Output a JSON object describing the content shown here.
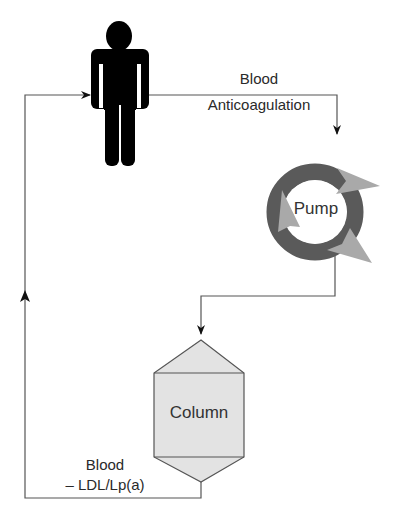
{
  "diagram": {
    "type": "flow-diagram",
    "nodes": {
      "patient": {
        "icon": "person-icon"
      },
      "pump": {
        "label": "Pump",
        "icon": "circular-arrows-icon"
      },
      "column": {
        "label": "Column"
      }
    },
    "edges": {
      "patient_to_pump": {
        "line1": "Blood",
        "line2": "Anticoagulation"
      },
      "column_to_patient": {
        "line1": "Blood",
        "line2": "– LDL/Lp(a)"
      }
    },
    "colors": {
      "line": "#555555",
      "person": "#000000",
      "pump_ring": "#555555",
      "pump_arrowheads": "#a8a8a8",
      "column_fill": "#e3e3e3",
      "column_stroke": "#555555"
    }
  }
}
